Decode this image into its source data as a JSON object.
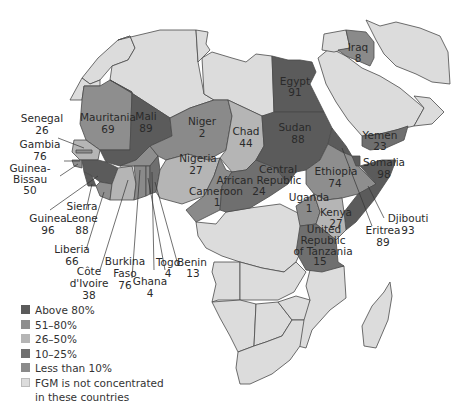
{
  "colors": {
    "above80": "#5b5b5b",
    "r51_80": "#8e8e8e",
    "r26_50": "#b5b5b5",
    "r10_25": "#6f6f6f",
    "less10": "#8a8a8a",
    "not_concentrated": "#dcdcdc",
    "border": "#4a4a4a",
    "background": "#ffffff"
  },
  "legend": {
    "items": [
      {
        "label": "Above 80%",
        "color": "#5b5b5b"
      },
      {
        "label": "51–80%",
        "color": "#8e8e8e"
      },
      {
        "label": "26–50%",
        "color": "#b5b5b5"
      },
      {
        "label": "10–25%",
        "color": "#6f6f6f"
      },
      {
        "label": "Less than 10%",
        "color": "#8a8a8a"
      },
      {
        "label": "FGM is not concentrated in these countries",
        "label_line1": "FGM is not concentrated",
        "label_line2": "in these countries",
        "color": "#dcdcdc"
      }
    ]
  },
  "countries": {
    "senegal": {
      "name": "Senegal",
      "value": "26"
    },
    "gambia": {
      "name": "Gambia",
      "value": "76"
    },
    "guinea_bissau": {
      "name_line1": "Guinea-",
      "name_line2": "Bissau",
      "value": "50"
    },
    "guinea": {
      "name": "Guinea",
      "value": "96"
    },
    "sierra_leone": {
      "name_line1": "Sierra",
      "name_line2": "Leone",
      "value": "88"
    },
    "liberia": {
      "name": "Liberia",
      "value": "66"
    },
    "cote_divoire": {
      "name_line1": "Côte",
      "name_line2": "d'Ivoire",
      "value": "38"
    },
    "burkina_faso": {
      "name_line1": "Burkina",
      "name_line2": "Faso",
      "value": "76"
    },
    "ghana": {
      "name": "Ghana",
      "value": "4"
    },
    "togo": {
      "name": "Togo",
      "value": "4"
    },
    "benin": {
      "name": "Benin",
      "value": "13"
    },
    "mauritania": {
      "name": "Mauritania",
      "value": "69"
    },
    "mali": {
      "name": "Mali",
      "value": "89"
    },
    "niger": {
      "name": "Niger",
      "value": "2"
    },
    "nigeria": {
      "name": "Nigeria",
      "value": "27"
    },
    "chad": {
      "name": "Chad",
      "value": "44"
    },
    "cameroon": {
      "name": "Cameroon",
      "value": "1"
    },
    "car": {
      "name_line1": "Central",
      "name_line2": "African Republic",
      "value": "24"
    },
    "egypt": {
      "name": "Egypt",
      "value": "91"
    },
    "sudan": {
      "name": "Sudan",
      "value": "88"
    },
    "ethiopia": {
      "name": "Ethiopia",
      "value": "74"
    },
    "eritrea": {
      "name": "Eritrea",
      "value": "89"
    },
    "djibouti": {
      "name": "Djibouti",
      "value": "93"
    },
    "somalia": {
      "name": "Somalia",
      "value": "98"
    },
    "uganda": {
      "name": "Uganda",
      "value": "1"
    },
    "kenya": {
      "name": "Kenya",
      "value": "27"
    },
    "tanzania": {
      "name_line1": "United",
      "name_line2": "Republic",
      "name_line3": "of Tanzania",
      "value": "15"
    },
    "iraq": {
      "name": "Iraq",
      "value": "8"
    },
    "yemen": {
      "name": "Yemen",
      "value": "23"
    }
  }
}
